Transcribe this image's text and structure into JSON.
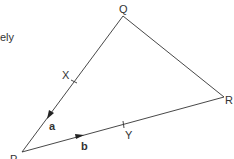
{
  "fragment_text": "ely",
  "diagram": {
    "type": "triangle-vectors",
    "vertices": {
      "P": {
        "label": "P",
        "x": 22,
        "y": 152
      },
      "Q": {
        "label": "Q",
        "x": 123,
        "y": 16
      },
      "R": {
        "label": "R",
        "x": 224,
        "y": 97
      }
    },
    "points": {
      "X": {
        "label": "X",
        "on": "PQ"
      },
      "Y": {
        "label": "Y",
        "on": "PR"
      }
    },
    "vectors": {
      "a": {
        "label": "a",
        "along": "PQ"
      },
      "b": {
        "label": "b",
        "along": "PR"
      }
    },
    "line_color": "#333333"
  }
}
